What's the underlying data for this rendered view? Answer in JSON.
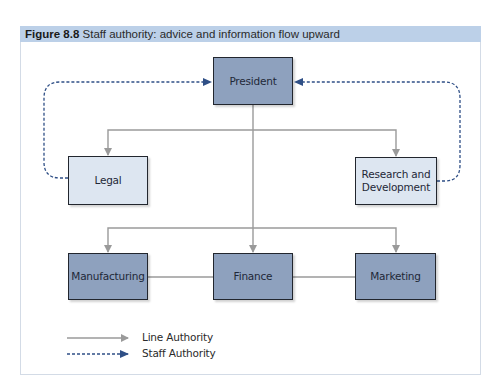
{
  "figure": {
    "label": "Figure 8.8",
    "caption": "Staff authority: advice and information flow upward"
  },
  "nodes": {
    "president": "President",
    "legal": "Legal",
    "research": "Research and Development",
    "manufacturing": "Manufacturing",
    "finance": "Finance",
    "marketing": "Marketing"
  },
  "legend": {
    "line_authority": "Line Authority",
    "staff_authority": "Staff Authority"
  },
  "colors": {
    "header_band": "#bcd0e8",
    "line_authority": "#9a9a9a",
    "staff_authority": "#2f4f86",
    "dark_box": "#8ea1be",
    "light_box": "#dde6f1"
  }
}
